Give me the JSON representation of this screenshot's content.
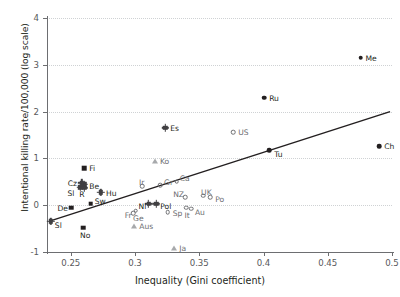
{
  "chart_data": {
    "type": "scatter",
    "title": "",
    "xlabel": "Inequality (Gini coefficient)",
    "ylabel": "Intentional killing rate/100,000 (log scale)",
    "xlim": [
      0.2315,
      0.5
    ],
    "ylim": [
      -1,
      4
    ],
    "xticks": [
      "0.25",
      "0.3",
      "0.35",
      "0.4",
      "0.45",
      "0.5"
    ],
    "xtick_values": [
      0.25,
      0.3,
      0.35,
      0.4,
      0.45,
      0.5
    ],
    "yticks": [
      "4",
      "3",
      "2",
      "1",
      "0",
      "-1"
    ],
    "ytick_values": [
      4,
      3,
      2,
      1,
      0,
      -1
    ],
    "grid": "horizontal-dotted",
    "legend": "none",
    "trendline": {
      "x0": 0.2335,
      "y0": -0.34,
      "x1": 0.4985,
      "y1": 2.0,
      "color": "#231f20"
    },
    "points": [
      {
        "label": "Me",
        "x": 0.4755,
        "y": 3.15,
        "marker": "circle-filled",
        "label_dx": 5,
        "label_dy": -3
      },
      {
        "label": "Ru",
        "x": 0.4005,
        "y": 2.3,
        "marker": "circle-filled",
        "label_dx": 5,
        "label_dy": -3
      },
      {
        "label": "Es",
        "x": 0.3235,
        "y": 1.655,
        "marker": "diamond",
        "label_dx": 5,
        "label_dy": -3
      },
      {
        "label": "US",
        "x": 0.3765,
        "y": 1.555,
        "marker": "circle-open",
        "label_dx": 5,
        "label_dy": -3
      },
      {
        "label": "Ch",
        "x": 0.49,
        "y": 1.265,
        "marker": "circle-filled",
        "label_dx": 5,
        "label_dy": -3
      },
      {
        "label": "Tu",
        "x": 0.4045,
        "y": 1.175,
        "marker": "circle-filled",
        "label_dx": 5,
        "label_dy": 1
      },
      {
        "label": "Ko",
        "x": 0.3155,
        "y": 0.955,
        "marker": "triangle",
        "label_dx": 5,
        "label_dy": -3
      },
      {
        "label": "Fi",
        "x": 0.2605,
        "y": 0.785,
        "marker": "square",
        "label_dx": 5,
        "label_dy": -3
      },
      {
        "label": "Cz",
        "x": 0.2585,
        "y": 0.475,
        "marker": "diamond",
        "label_dx": -14,
        "label_dy": -3
      },
      {
        "label": "Be",
        "x": 0.2605,
        "y": 0.445,
        "marker": "diamond",
        "label_dx": 5,
        "label_dy": -1
      },
      {
        "label": "Gr",
        "x": 0.3195,
        "y": 0.425,
        "marker": "circle-open",
        "label_dx": 4,
        "label_dy": -6
      },
      {
        "label": "Ca",
        "x": 0.3325,
        "y": 0.5,
        "marker": "circle-open",
        "label_dx": 3,
        "label_dy": -7
      },
      {
        "label": "Sl",
        "x": 0.2575,
        "y": 0.385,
        "marker": "diamond",
        "label_dx": -13,
        "label_dy": 3
      },
      {
        "label": "R",
        "x": 0.2605,
        "y": 0.375,
        "marker": "diamond",
        "label_dx": -5,
        "label_dy": 3
      },
      {
        "label": "Ir",
        "x": 0.3055,
        "y": 0.405,
        "marker": "circle-open",
        "label_dx": -3,
        "label_dy": -7
      },
      {
        "label": "Hu",
        "x": 0.2735,
        "y": 0.275,
        "marker": "diamond",
        "label_dx": 5,
        "label_dy": -2
      },
      {
        "label": "UK",
        "x": 0.353,
        "y": 0.205,
        "marker": "circle-open",
        "label_dx": -2,
        "label_dy": -7
      },
      {
        "label": "NZ",
        "x": 0.339,
        "y": 0.175,
        "marker": "circle-open",
        "label_dx": -12,
        "label_dy": -6
      },
      {
        "label": "Po",
        "x": 0.3585,
        "y": 0.175,
        "marker": "circle-open",
        "label_dx": 5,
        "label_dy": -1
      },
      {
        "label": "Sw",
        "x": 0.2655,
        "y": 0.03,
        "marker": "square",
        "label_dx": 4,
        "label_dy": -6
      },
      {
        "label": "Nl",
        "x": 0.3105,
        "y": 0.025,
        "marker": "diamond",
        "label_dx": -10,
        "label_dy": -1
      },
      {
        "label": "Pol",
        "x": 0.3165,
        "y": 0.025,
        "marker": "diamond",
        "label_dx": 4,
        "label_dy": -1
      },
      {
        "label": "De",
        "x": 0.2505,
        "y": -0.055,
        "marker": "square",
        "label_dx": -14,
        "label_dy": -3
      },
      {
        "label": "It",
        "x": 0.34,
        "y": -0.055,
        "marker": "circle-open",
        "label_dx": -2,
        "label_dy": 4
      },
      {
        "label": "Au",
        "x": 0.3435,
        "y": -0.075,
        "marker": "circle-open",
        "label_dx": 4,
        "label_dy": 0
      },
      {
        "label": "Fr",
        "x": 0.3005,
        "y": -0.115,
        "marker": "circle-open",
        "label_dx": -11,
        "label_dy": 1
      },
      {
        "label": "Sp",
        "x": 0.3255,
        "y": -0.145,
        "marker": "circle-open",
        "label_dx": 5,
        "label_dy": -2
      },
      {
        "label": "Ge",
        "x": 0.2985,
        "y": -0.165,
        "marker": "circle-open",
        "label_dx": 0,
        "label_dy": 2
      },
      {
        "label": "Sl2",
        "x": 0.2345,
        "y": -0.345,
        "marker": "diamond",
        "label_dx": 4,
        "label_dy": 1,
        "display": "Sl"
      },
      {
        "label": "No",
        "x": 0.2595,
        "y": -0.48,
        "marker": "square",
        "label_dx": -3,
        "label_dy": 4
      },
      {
        "label": "Aus",
        "x": 0.2995,
        "y": -0.45,
        "marker": "triangle",
        "label_dx": 5,
        "label_dy": -3
      },
      {
        "label": "Ja",
        "x": 0.3305,
        "y": -0.92,
        "marker": "triangle",
        "label_dx": 5,
        "label_dy": -3
      }
    ]
  }
}
